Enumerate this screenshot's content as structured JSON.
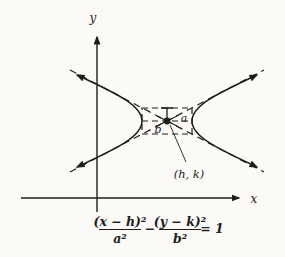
{
  "figure": {
    "type": "math-diagram",
    "colors": {
      "background": "#fbfaf7",
      "ink": "#1d1d1b"
    },
    "axes": {
      "x_label": "x",
      "y_label": "y"
    },
    "labels": {
      "a": "a",
      "b": "b",
      "center": "(h, k)"
    },
    "equation": {
      "numerator1": "(x − h)²",
      "denominator1": "a²",
      "operator": "−",
      "numerator2": "(y − k)²",
      "denominator2": "b²",
      "rhs": "= 1"
    }
  }
}
